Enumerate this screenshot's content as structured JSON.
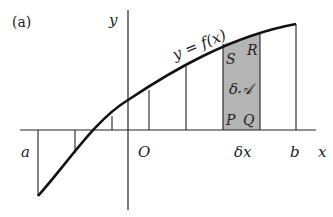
{
  "panel_label": "(a)",
  "axes": {
    "x_label": "x",
    "y_label": "y",
    "origin_label": "O"
  },
  "curve_label": "y = f(x)",
  "bounds": {
    "a": "a",
    "b": "b"
  },
  "strip": {
    "corners": {
      "S": "S",
      "R": "R",
      "P": "P",
      "Q": "Q"
    },
    "area_label": "δ𝒜",
    "width_label": "δx",
    "fill": "#b4b4b4"
  }
}
